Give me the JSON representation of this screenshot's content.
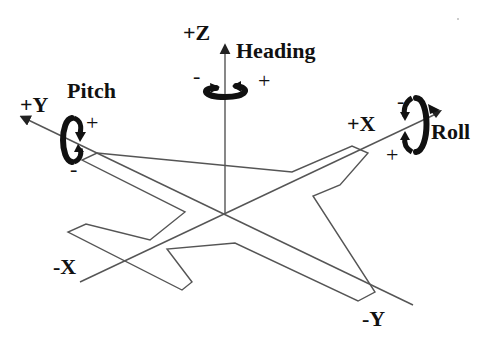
{
  "diagram": {
    "colors": {
      "background": "#ffffff",
      "line": "#555555",
      "ink": "#111111"
    },
    "axes": {
      "z_pos": "+Z",
      "y_pos": "+Y",
      "y_neg": "-Y",
      "x_pos": "+X",
      "x_neg": "-X"
    },
    "rotations": {
      "heading": {
        "label": "Heading",
        "neg": "-",
        "pos": "+"
      },
      "pitch": {
        "label": "Pitch",
        "neg": "-",
        "pos": "+"
      },
      "roll": {
        "label": "Roll",
        "neg": "-",
        "pos": "+"
      }
    }
  }
}
